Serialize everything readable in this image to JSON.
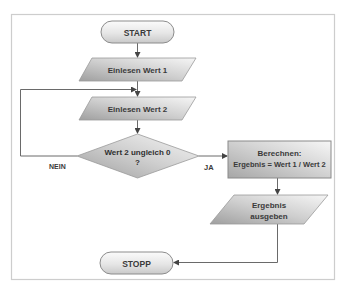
{
  "diagram": {
    "type": "flowchart",
    "frame": {
      "border_color": "#c8c8c8"
    },
    "colors": {
      "fill_light": "#f4f4f4",
      "fill_dark": "#a9a9a9",
      "stroke": "#8c8c8c",
      "connector": "#6a6a6a",
      "text": "#3a3a3a"
    },
    "nodes": {
      "start": {
        "label": "START",
        "shape": "terminator"
      },
      "input1": {
        "label": "Einlesen Wert 1",
        "shape": "input-output"
      },
      "input2": {
        "label": "Einlesen Wert 2",
        "shape": "input-output"
      },
      "decision": {
        "line1": "Wert 2 ungleich 0",
        "line2": "?",
        "shape": "decision"
      },
      "process": {
        "line1": "Berechnen:",
        "line2": "Ergebnis = Wert 1 / Wert 2",
        "shape": "process"
      },
      "output": {
        "line1": "Ergebnis",
        "line2": "ausgeben",
        "shape": "input-output"
      },
      "stop": {
        "label": "STOPP",
        "shape": "terminator"
      }
    },
    "edges": {
      "no_label": "NEIN",
      "yes_label": "JA"
    }
  }
}
